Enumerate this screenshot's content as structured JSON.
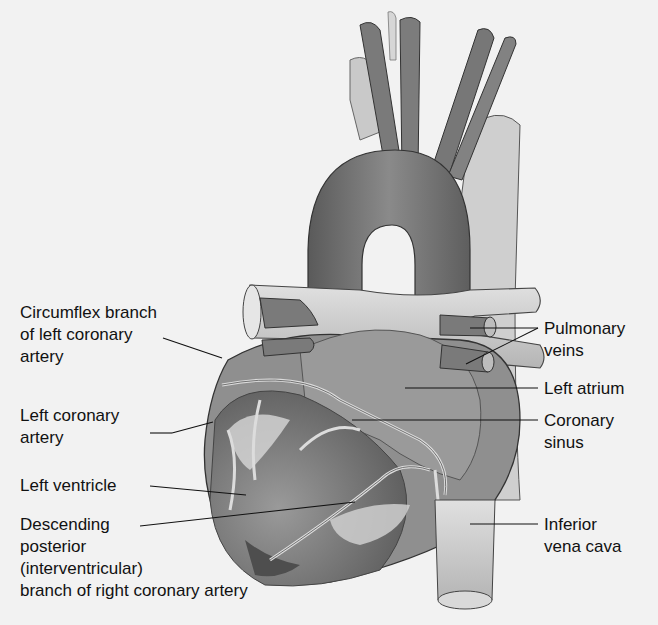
{
  "diagram": {
    "labels_left": [
      {
        "id": "circumflex",
        "lines": [
          "Circumflex branch",
          "of left coronary",
          "artery"
        ]
      },
      {
        "id": "left-coronary",
        "lines": [
          "Left coronary",
          "artery"
        ]
      },
      {
        "id": "left-ventricle",
        "lines": [
          "Left ventricle"
        ]
      },
      {
        "id": "descending-posterior",
        "lines": [
          "Descending",
          "posterior",
          "(interventricular)",
          "branch of right coronary artery"
        ]
      }
    ],
    "labels_right": [
      {
        "id": "pulmonary-veins",
        "lines": [
          "Pulmonary",
          "veins"
        ]
      },
      {
        "id": "left-atrium",
        "lines": [
          "Left atrium"
        ]
      },
      {
        "id": "coronary-sinus",
        "lines": [
          "Coronary",
          "sinus"
        ]
      },
      {
        "id": "inferior-vena-cava",
        "lines": [
          "Inferior",
          "vena cava"
        ]
      }
    ],
    "colors": {
      "background": "#f2f2f2",
      "tissue_dark": "#6e6e6e",
      "tissue_mid": "#8c8c8c",
      "tissue_light": "#bdbdbd",
      "vessel_light": "#d0d0d0",
      "outline": "#3a3a3a",
      "label_text": "#111111"
    }
  }
}
